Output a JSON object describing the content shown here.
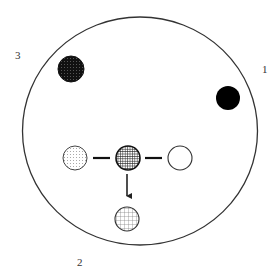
{
  "diagram": {
    "type": "dish-schematic",
    "colors": {
      "stroke": "#222222",
      "dark_fill": "#1a1a1a",
      "black_fill": "#000000",
      "background": "#ffffff"
    },
    "region_labels": [
      {
        "id": "label-1",
        "text": "1"
      },
      {
        "id": "label-2",
        "text": "2"
      },
      {
        "id": "label-3",
        "text": "3"
      }
    ],
    "spots": [
      {
        "id": "spot-top-left",
        "pattern": "dark-stipple",
        "description": "densely stippled dark spot"
      },
      {
        "id": "spot-right",
        "pattern": "solid-black",
        "description": "solid black spot"
      },
      {
        "id": "spot-row-left",
        "pattern": "light-dots",
        "description": "lightly dotted spot"
      },
      {
        "id": "spot-row-center",
        "pattern": "dense-crosshatch",
        "description": "dense crosshatched spot"
      },
      {
        "id": "spot-row-right",
        "pattern": "empty",
        "description": "open empty spot"
      },
      {
        "id": "spot-bottom",
        "pattern": "light-grid",
        "description": "light grid spot"
      }
    ],
    "connections": [
      {
        "from": "spot-row-left",
        "to": "spot-row-center",
        "kind": "line"
      },
      {
        "from": "spot-row-center",
        "to": "spot-row-right",
        "kind": "line"
      },
      {
        "from": "spot-row-center",
        "to": "spot-bottom",
        "kind": "arrow"
      }
    ]
  }
}
